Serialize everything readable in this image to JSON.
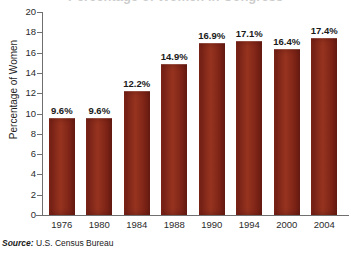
{
  "chart_data": {
    "type": "bar",
    "title": "Percentage of Women in Congress",
    "categories": [
      "1976",
      "1980",
      "1984",
      "1988",
      "1990",
      "1994",
      "2000",
      "2004"
    ],
    "values": [
      9.6,
      9.6,
      12.2,
      14.9,
      16.9,
      17.1,
      16.4,
      17.4
    ],
    "data_labels": [
      "9.6%",
      "9.6%",
      "12.2%",
      "14.9%",
      "16.9%",
      "17.1%",
      "16.4%",
      "17.4%"
    ],
    "xlabel": "",
    "ylabel": "Percentage of Women",
    "ylim": [
      0,
      20
    ],
    "ytick_labels": [
      "20",
      "18",
      "16",
      "14",
      "12",
      "10",
      "8",
      "6",
      "4",
      "2",
      "0"
    ],
    "ytick_values": [
      20,
      18,
      16,
      14,
      12,
      10,
      8,
      6,
      4,
      2,
      0
    ],
    "grid": false,
    "legend": false,
    "bar_color": "#8a2a1c",
    "axis_color": "#6f6f6f",
    "text_color": "#1a1a1a"
  },
  "source": {
    "label": "Source:",
    "text": "U.S. Census Bureau"
  }
}
